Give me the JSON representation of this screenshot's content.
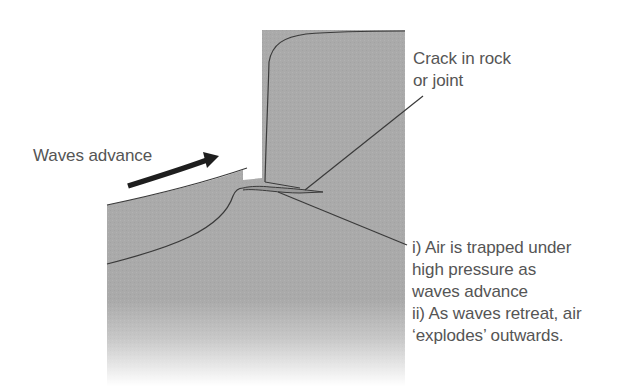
{
  "diagram": {
    "colors": {
      "rock_fill": "#a9a9a9",
      "cliff_fill": "#adadad",
      "outline": "#3a3a3a",
      "arrow": "#1e1e1e",
      "text": "#555555",
      "background": "#ffffff"
    },
    "labels": {
      "waves": {
        "text": "Waves advance"
      },
      "crack": {
        "lines": [
          "Crack in rock",
          "or joint"
        ]
      },
      "explanation": {
        "lines": [
          "i) Air is trapped under",
          "high pressure as",
          "waves advance",
          "ii) As waves retreat, air",
          "‘explodes’ outwards."
        ]
      }
    },
    "icons": {
      "wave_arrow": "curved-arrow-right"
    }
  }
}
